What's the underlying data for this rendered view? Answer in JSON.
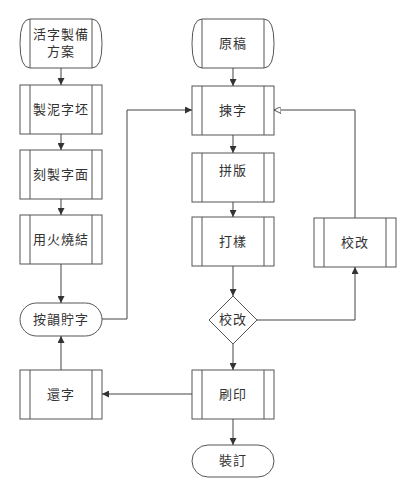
{
  "diagram": {
    "title": "",
    "nodes": {
      "plan": {
        "label_line1": "活字製備",
        "label_line2": "方案",
        "shape": "stored-data"
      },
      "clay": {
        "label": "製泥字坯",
        "shape": "predefined-process"
      },
      "carve": {
        "label": "刻製字面",
        "shape": "predefined-process"
      },
      "fire": {
        "label": "用火燒結",
        "shape": "predefined-process"
      },
      "store": {
        "label": "按韻貯字",
        "shape": "terminal"
      },
      "return": {
        "label": "還字",
        "shape": "predefined-process"
      },
      "manuscript": {
        "label": "原稿",
        "shape": "stored-data"
      },
      "pick": {
        "label": "揀字",
        "shape": "predefined-process"
      },
      "compose": {
        "label": "拼版",
        "shape": "predefined-process"
      },
      "proof": {
        "label": "打樣",
        "shape": "predefined-process"
      },
      "check": {
        "label": "校改",
        "shape": "decision"
      },
      "revise": {
        "label": "校改",
        "shape": "predefined-process"
      },
      "print": {
        "label": "刷印",
        "shape": "predefined-process"
      },
      "bind": {
        "label": "裝訂",
        "shape": "terminal"
      }
    },
    "edges": [
      [
        "活字製備方案",
        "製泥字坯"
      ],
      [
        "製泥字坯",
        "刻製字面"
      ],
      [
        "刻製字面",
        "用火燒結"
      ],
      [
        "用火燒結",
        "按韻貯字"
      ],
      [
        "按韻貯字",
        "揀字"
      ],
      [
        "原稿",
        "揀字"
      ],
      [
        "揀字",
        "拼版"
      ],
      [
        "拼版",
        "打樣"
      ],
      [
        "打樣",
        "校改 (decision)"
      ],
      [
        "校改 (decision)",
        "校改 (process)"
      ],
      [
        "校改 (process)",
        "揀字"
      ],
      [
        "校改 (decision)",
        "刷印"
      ],
      [
        "刷印",
        "還字"
      ],
      [
        "還字",
        "按韻貯字"
      ],
      [
        "刷印",
        "裝訂"
      ]
    ],
    "colors": {
      "stroke": "#555555",
      "text": "#333333",
      "background": "#ffffff"
    }
  }
}
